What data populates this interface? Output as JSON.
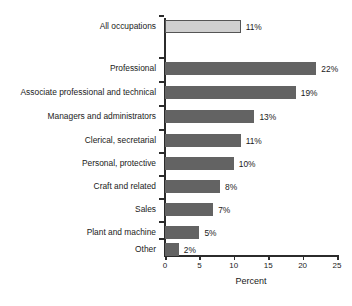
{
  "chart_data": {
    "type": "bar",
    "orientation": "horizontal",
    "title": "",
    "xlabel": "Percent",
    "ylabel": "",
    "xlim": [
      0,
      25
    ],
    "xticks": [
      0,
      5,
      10,
      15,
      20,
      25
    ],
    "grid": false,
    "legend": false,
    "value_suffix": "%",
    "categories": [
      "All occupations",
      "Professional",
      "Associate professional and technical",
      "Managers and administrators",
      "Clerical, secretarial",
      "Personal, protective",
      "Craft and related",
      "Sales",
      "Plant and machine",
      "Other"
    ],
    "values": [
      11,
      22,
      19,
      13,
      11,
      10,
      8,
      7,
      5,
      2
    ],
    "value_labels": [
      "11%",
      "22%",
      "19%",
      "13%",
      "11%",
      "10%",
      "8%",
      "7%",
      "5%",
      "2%"
    ],
    "bar_styles": [
      "light",
      "dark",
      "dark",
      "dark",
      "dark",
      "dark",
      "dark",
      "dark",
      "dark",
      "dark"
    ],
    "colors": {
      "bar_dark": "#636363",
      "bar_light": "#cfcfcf",
      "bar_light_border": "#555555",
      "axis": "#2b2b2b",
      "text": "#1a1a1a",
      "background": "#ffffff"
    }
  },
  "axis": {
    "x_tick_labels": [
      "0",
      "5",
      "10",
      "15",
      "20",
      "25"
    ],
    "x_label": "Percent"
  }
}
